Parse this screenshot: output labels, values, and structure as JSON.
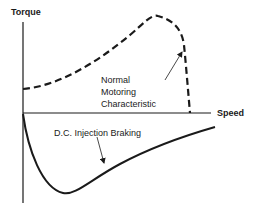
{
  "diagram": {
    "axes": {
      "y_label": "Torque",
      "x_label": "Speed"
    },
    "curves": [
      {
        "name": "Normal Motoring Characteristic",
        "style": "dashed",
        "region": "positive torque"
      },
      {
        "name": "D.C. Injection Braking",
        "style": "solid",
        "region": "negative torque"
      }
    ],
    "annotations": {
      "motoring_lines": [
        "Normal",
        "Motoring",
        "Characteristic"
      ],
      "braking": "D.C. Injection Braking"
    },
    "colors": {
      "ink": "#1a1a1a",
      "background": "#ffffff"
    }
  }
}
